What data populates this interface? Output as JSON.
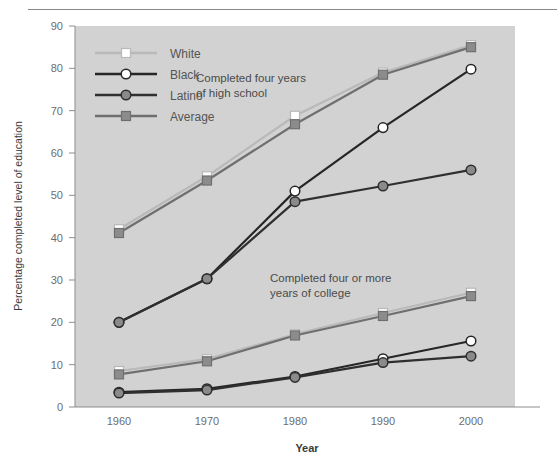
{
  "chart_data": {
    "type": "line",
    "title": "",
    "xlabel": "Year",
    "ylabel": "Percentage completed level of education",
    "categories": [
      1960,
      1970,
      1980,
      1990,
      2000
    ],
    "xtick_labels": [
      "1960",
      "1970",
      "1980",
      "1990",
      "2000"
    ],
    "ytick_labels": [
      "0",
      "10",
      "20",
      "30",
      "40",
      "50",
      "60",
      "70",
      "80",
      "90"
    ],
    "xlim": [
      1955,
      2005
    ],
    "ylim": [
      0,
      90
    ],
    "grid": false,
    "legend_position": "top-left",
    "plot_background": "#d2d2d2",
    "annotations": [
      {
        "name": "high-school-annotation",
        "line1": "Completed four years",
        "line2": "of high school"
      },
      {
        "name": "college-annotation",
        "line1": "Completed four or more",
        "line2": "years of college"
      }
    ],
    "groups": [
      {
        "name": "Completed four years of high school",
        "series": [
          {
            "name": "White",
            "values": [
              42.0,
              54.5,
              68.8,
              79.0,
              85.5
            ],
            "color": "#b9b9b9",
            "marker": "square",
            "marker_fill": "#ffffff"
          },
          {
            "name": "Black",
            "values": [
              20.0,
              30.3,
              51.0,
              66.0,
              79.8
            ],
            "color": "#262626",
            "marker": "circle",
            "marker_fill": "#ffffff"
          },
          {
            "name": "Latino",
            "values": [
              20.0,
              30.3,
              48.5,
              52.2,
              56.0
            ],
            "color": "#2f2f2f",
            "marker": "circle",
            "marker_fill": "#8a8a8a"
          },
          {
            "name": "Average",
            "values": [
              41.1,
              53.5,
              66.8,
              78.5,
              85.0
            ],
            "color": "#6f6f6f",
            "marker": "square",
            "marker_fill": "#8c8c8c"
          }
        ]
      },
      {
        "name": "Completed four or more years of college",
        "series": [
          {
            "name": "White",
            "values": [
              8.5,
              11.3,
              17.2,
              22.2,
              27.0
            ],
            "color": "#b9b9b9",
            "marker": "square",
            "marker_fill": "#ffffff"
          },
          {
            "name": "Black",
            "values": [
              3.5,
              4.3,
              7.2,
              11.4,
              15.6
            ],
            "color": "#262626",
            "marker": "circle",
            "marker_fill": "#ffffff"
          },
          {
            "name": "Latino",
            "values": [
              3.3,
              4.0,
              7.0,
              10.5,
              12.0
            ],
            "color": "#2f2f2f",
            "marker": "circle",
            "marker_fill": "#8a8a8a"
          },
          {
            "name": "Average",
            "values": [
              7.7,
              10.8,
              16.9,
              21.5,
              26.2
            ],
            "color": "#6f6f6f",
            "marker": "square",
            "marker_fill": "#8c8c8c"
          }
        ]
      }
    ],
    "legend": [
      {
        "label": "White",
        "color": "#b9b9b9",
        "marker": "square",
        "marker_fill": "#ffffff"
      },
      {
        "label": "Black",
        "color": "#262626",
        "marker": "circle",
        "marker_fill": "#ffffff"
      },
      {
        "label": "Latino",
        "color": "#2f2f2f",
        "marker": "circle",
        "marker_fill": "#8a8a8a"
      },
      {
        "label": "Average",
        "color": "#6f6f6f",
        "marker": "square",
        "marker_fill": "#8c8c8c"
      }
    ]
  }
}
